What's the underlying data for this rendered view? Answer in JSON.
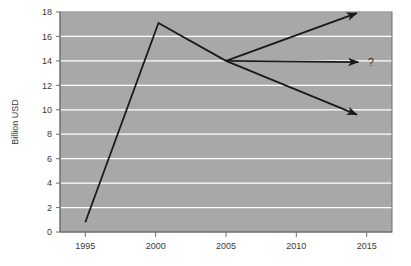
{
  "chart_data": {
    "type": "line",
    "title": "",
    "subtitle": "",
    "xlabel": "",
    "ylabel": "Billion USD",
    "xlim": [
      1993.2,
      2016.8
    ],
    "ylim": [
      0,
      18
    ],
    "xticks": [
      1995,
      2000,
      2005,
      2010,
      2015
    ],
    "yticks": [
      0,
      2,
      4,
      6,
      8,
      10,
      12,
      14,
      16,
      18
    ],
    "grid": "horizontal",
    "legend": "none",
    "plot_background": "#a8a8a8",
    "gridline_color": "#ffffff",
    "line_color": "#1a1a1a",
    "series": [
      {
        "name": "historical",
        "style": "solid",
        "arrow": false,
        "points": [
          {
            "x": 1995,
            "y": 0.8
          },
          {
            "x": 2000.2,
            "y": 17.1
          },
          {
            "x": 2005,
            "y": 14.0
          }
        ]
      },
      {
        "name": "optimistic-projection",
        "style": "solid",
        "arrow": true,
        "points": [
          {
            "x": 2005,
            "y": 14.0
          },
          {
            "x": 2014.3,
            "y": 17.9
          }
        ]
      },
      {
        "name": "flat-projection",
        "style": "solid",
        "arrow": true,
        "points": [
          {
            "x": 2005,
            "y": 14.0
          },
          {
            "x": 2014.4,
            "y": 13.9
          }
        ]
      },
      {
        "name": "pessimistic-projection",
        "style": "solid",
        "arrow": true,
        "points": [
          {
            "x": 2005,
            "y": 14.0
          },
          {
            "x": 2014.3,
            "y": 9.6
          }
        ]
      }
    ],
    "annotations": [
      {
        "text": "?",
        "x": 2015.3,
        "y": 13.9
      }
    ]
  },
  "axis": {
    "y_title": "Billion USD",
    "y_tick_labels": [
      "0",
      "2",
      "4",
      "6",
      "8",
      "10",
      "12",
      "14",
      "16",
      "18"
    ],
    "x_tick_labels": [
      "1995",
      "2000",
      "2005",
      "2010",
      "2015"
    ]
  },
  "annotation": {
    "question_mark": "?"
  }
}
